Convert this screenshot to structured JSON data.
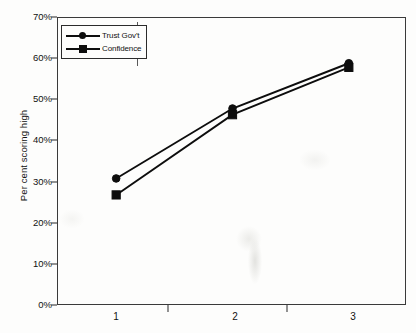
{
  "chart_data": {
    "type": "line",
    "title": "",
    "subtitle": "",
    "xlabel": "",
    "ylabel": "Per cent scoring high",
    "categories": [
      "1",
      "2",
      "3"
    ],
    "series": [
      {
        "name": "Trust Gov't",
        "marker": "circle",
        "values": [
          31,
          48,
          59
        ]
      },
      {
        "name": "Confidence",
        "marker": "square",
        "values": [
          27,
          46.5,
          58
        ]
      }
    ],
    "ylim": [
      0,
      70
    ],
    "ytick_values": [
      70,
      60,
      50,
      40,
      30,
      20,
      10,
      0
    ],
    "ytick_labels": [
      "70%",
      "60%",
      "50%",
      "40%",
      "30%",
      "20%",
      "10%",
      "0%"
    ],
    "xtick_labels": [
      "1",
      "2",
      "3"
    ],
    "grid": false,
    "legend_position": "top-left",
    "colors": {
      "series": "#0d0d0d",
      "axis": "#3a3a3a",
      "text": "#111111",
      "background": "#fdfdfc"
    }
  },
  "legend": {
    "entries": [
      {
        "label": "Trust Gov't"
      },
      {
        "label": "Confidence"
      }
    ]
  }
}
